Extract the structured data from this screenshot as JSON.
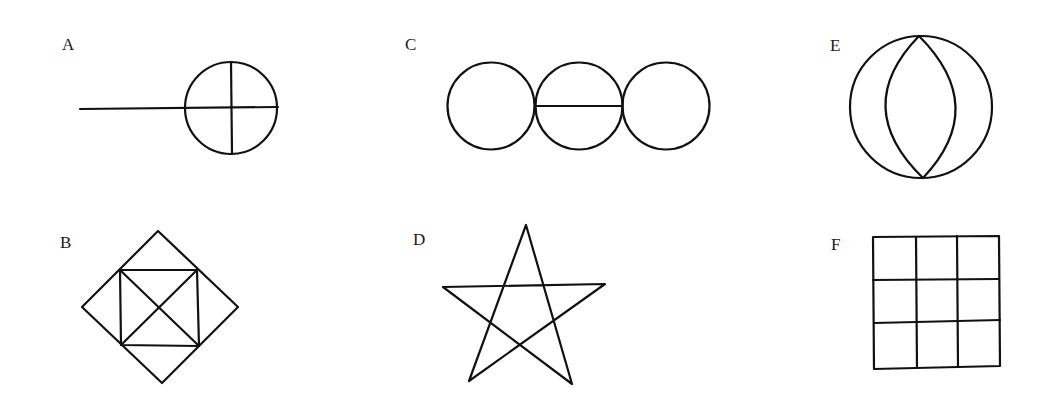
{
  "figures": [
    {
      "id": "A",
      "label": "A",
      "description": "Horizontal line ending at a circle divided into quarters by a cross"
    },
    {
      "id": "B",
      "label": "B",
      "description": "Diamond (rotated square) with an inscribed square whose corners touch the diamond edges, with both diagonals drawn"
    },
    {
      "id": "C",
      "label": "C",
      "description": "Three tangent circles in a row; the middle circle has a horizontal diameter"
    },
    {
      "id": "D",
      "label": "D",
      "description": "Five-pointed star (pentagram)"
    },
    {
      "id": "E",
      "label": "E",
      "description": "Circle containing a vertical lens shape formed by two arcs meeting at top and bottom of the circle"
    },
    {
      "id": "F",
      "label": "F",
      "description": "Square divided into a 3x3 grid"
    }
  ],
  "style": {
    "stroke_color": "#111111",
    "background": "#ffffff"
  }
}
